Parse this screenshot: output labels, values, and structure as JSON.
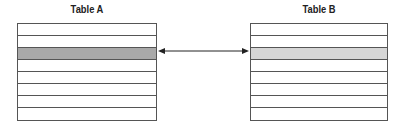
{
  "table_a": {
    "title": "Table A",
    "rows": 8,
    "highlighted_row": 3,
    "highlight_color": "#a9a9a9"
  },
  "table_b": {
    "title": "Table B",
    "rows": 8,
    "highlighted_row": 3,
    "highlight_color": "#d6d6d6"
  },
  "connector": {
    "type": "double-headed-arrow",
    "from": "Table A row 3",
    "to": "Table B row 3"
  }
}
